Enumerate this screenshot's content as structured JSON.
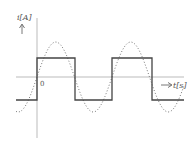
{
  "diagram": {
    "y_axis_label": "i[A]",
    "x_axis_label": "t[s]",
    "origin_label": "0",
    "colors": {
      "axis": "#aaaaaa",
      "square_wave": "#444444",
      "sine_wave": "#777777",
      "background": "#ffffff"
    },
    "geometry": {
      "origin": [
        37,
        77
      ],
      "x_axis_range": [
        16,
        184
      ],
      "y_axis_range": [
        14,
        138
      ],
      "square_high_y": 58,
      "square_low_y": 100,
      "square_edges_x": [
        37,
        75,
        112,
        152
      ],
      "square_x_range": [
        16,
        184
      ],
      "sine_amplitude_px": 35,
      "sine_period_px": 75
    }
  },
  "chart_data": {
    "type": "line",
    "title": "",
    "xlabel": "t[s]",
    "ylabel": "i[A]",
    "grid": false,
    "series": [
      {
        "name": "square wave",
        "style": "solid",
        "description": "rectangular current, +1 for 0<t<T/2, -1 for T/2<t<T",
        "levels": [
          1,
          -1
        ]
      },
      {
        "name": "fundamental sine",
        "style": "dotted",
        "description": "sinusoid in phase with square wave, amplitude slightly greater than square level"
      }
    ],
    "annotations": [
      "0"
    ]
  }
}
